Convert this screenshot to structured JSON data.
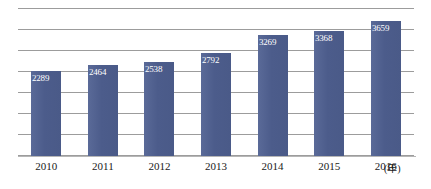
{
  "chart_data": {
    "type": "bar",
    "title": "",
    "xlabel": "(年)",
    "ylabel": "",
    "categories": [
      "2010",
      "2011",
      "2012",
      "2013",
      "2014",
      "2015",
      "2016"
    ],
    "values": [
      2289,
      2464,
      2538,
      2792,
      3269,
      3368,
      3659
    ],
    "series": [
      {
        "name": "",
        "values": [
          2289,
          2464,
          2538,
          2792,
          3269,
          3368,
          3659
        ]
      }
    ],
    "data_labels": [
      "2289",
      "2464",
      "2538",
      "2792",
      "3269",
      "3368",
      "3659"
    ],
    "ylim": [
      0,
      4000
    ],
    "grid": true,
    "gridline_count": 8,
    "legend": false,
    "legend_position": "none",
    "bar_color": "#4f5f8d",
    "data_label_color": "#ffffff",
    "gridline_color": "#8b8b8b",
    "axis_color": "#b6b6b6",
    "background": "#ffffff"
  },
  "axis": {
    "x_unit_label": "(年)"
  }
}
